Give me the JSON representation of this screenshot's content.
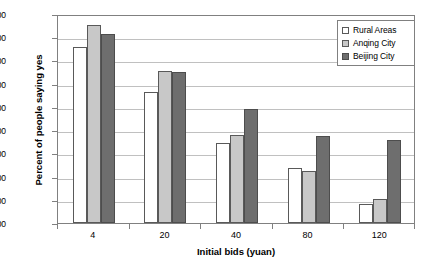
{
  "chart_data": {
    "type": "bar",
    "title": "",
    "xlabel": "Initial bids (yuan)",
    "ylabel": "Percent of people saying yes",
    "categories": [
      "4",
      "20",
      "40",
      "80",
      "120"
    ],
    "series": [
      {
        "name": "Rural Areas",
        "color": "#ffffff",
        "values": [
          76.0,
          56.5,
          34.3,
          23.5,
          8.1
        ]
      },
      {
        "name": "Anqing City",
        "color": "#c8c8c8",
        "values": [
          85.3,
          65.3,
          38.1,
          22.2,
          10.2
        ]
      },
      {
        "name": "Beijing City",
        "color": "#6e6e6e",
        "values": [
          81.3,
          65.2,
          48.9,
          37.6,
          35.7
        ]
      }
    ],
    "ylim": [
      0,
      90
    ],
    "ytick_step": 10,
    "ytick_labels": [
      "0.00",
      "10.00",
      "20.00",
      "30.00",
      "40.00",
      "50.00",
      "60.00",
      "70.00",
      "80.00",
      "90.00"
    ],
    "grid": true,
    "legend_position": "top-right"
  }
}
